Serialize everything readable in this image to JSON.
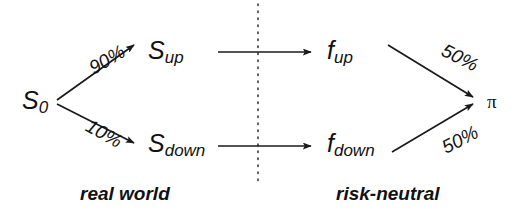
{
  "diagram": {
    "stroke_color": "#1a1a1a",
    "text_color": "#111111",
    "background_color": "#ffffff",
    "divider": {
      "style": "dotted",
      "orientation": "vertical",
      "x": 258,
      "y_start": 4,
      "y_end": 186
    },
    "nodes": [
      {
        "id": "s0",
        "base": "S",
        "sub": "0",
        "x": 22,
        "y": 88
      },
      {
        "id": "sup",
        "base": "S",
        "sub": "up",
        "x": 148,
        "y": 38
      },
      {
        "id": "sdown",
        "base": "S",
        "sub": "down",
        "x": 148,
        "y": 131
      },
      {
        "id": "fup",
        "base": "f",
        "sub": "up",
        "x": 327,
        "y": 38
      },
      {
        "id": "fdown",
        "base": "f",
        "sub": "down",
        "x": 327,
        "y": 131
      },
      {
        "id": "pi",
        "base": "π",
        "sub": "",
        "x": 487,
        "y": 92
      }
    ],
    "edges": [
      {
        "id": "s0-to-sup",
        "label": "90%",
        "from": "s0",
        "to": "sup",
        "label_x": 88,
        "label_y": 50,
        "rotation": -31
      },
      {
        "id": "s0-to-sdown",
        "label": "10%",
        "from": "s0",
        "to": "sdown",
        "label_x": 85,
        "label_y": 124,
        "rotation": 29
      },
      {
        "id": "sup-to-fup",
        "label": "",
        "from": "sup",
        "to": "fup",
        "label_x": 0,
        "label_y": 0,
        "rotation": 0
      },
      {
        "id": "sdown-to-fdown",
        "label": "",
        "from": "sdown",
        "to": "fdown",
        "label_x": 0,
        "label_y": 0,
        "rotation": 0
      },
      {
        "id": "fup-to-pi",
        "label": "50%",
        "from": "fup",
        "to": "pi",
        "label_x": 441,
        "label_y": 48,
        "rotation": 27
      },
      {
        "id": "fdown-to-pi",
        "label": "50%",
        "from": "fdown",
        "to": "pi",
        "label_x": 441,
        "label_y": 130,
        "rotation": -27
      }
    ],
    "captions": [
      {
        "id": "caption-real-world",
        "text": "real world",
        "x": 80,
        "y": 184
      },
      {
        "id": "caption-risk-neutral",
        "text": "risk-neutral",
        "x": 336,
        "y": 184
      }
    ]
  }
}
